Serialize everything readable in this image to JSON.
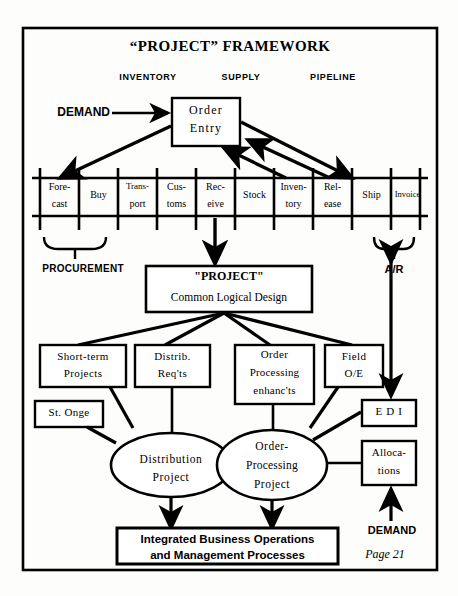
{
  "page": {
    "title": "“PROJECT”  FRAMEWORK",
    "page_number": "Page  21",
    "frame_color": "#000000",
    "bg_color": "#fdfdfb"
  },
  "column_headers": [
    {
      "label": "INVENTORY"
    },
    {
      "label": "SUPPLY"
    },
    {
      "label": "PIPELINE"
    }
  ],
  "demand_top": {
    "label": "DEMAND"
  },
  "demand_bottom": {
    "label": "DEMAND"
  },
  "order_entry": {
    "line1": "Order",
    "line2": "Entry"
  },
  "pipeline": {
    "cells": [
      {
        "line1": "Fore-",
        "line2": "cast"
      },
      {
        "line1": "Buy",
        "line2": ""
      },
      {
        "line1": "Trans-",
        "line2": "port"
      },
      {
        "line1": "Cus-",
        "line2": "toms"
      },
      {
        "line1": "Rec-",
        "line2": "eive"
      },
      {
        "line1": "Stock",
        "line2": ""
      },
      {
        "line1": "Inven-",
        "line2": "tory"
      },
      {
        "line1": "Rel-",
        "line2": "ease"
      },
      {
        "line1": "Ship",
        "line2": ""
      },
      {
        "line1": "Invoice",
        "line2": ""
      }
    ]
  },
  "brace_labels": {
    "procurement": "PROCUREMENT",
    "ar": "A/R"
  },
  "project_box": {
    "line1": "\"PROJECT\"",
    "line2": "Common  Logical  Design"
  },
  "initiative_boxes": [
    {
      "line1": "Short-term",
      "line2": "Projects",
      "line3": ""
    },
    {
      "line1": "Distrib.",
      "line2": "Req'ts",
      "line3": ""
    },
    {
      "line1": "Order",
      "line2": "Processing",
      "line3": "enhanc'ts"
    },
    {
      "line1": "Field",
      "line2": "O/E",
      "line3": ""
    }
  ],
  "side_boxes": {
    "st_onge": "St.  Onge",
    "edi": "E D I",
    "allocations_line1": "Alloca-",
    "allocations_line2": "tions"
  },
  "ellipses": [
    {
      "line1": "Distribution",
      "line2": "Project"
    },
    {
      "line1": "Order-",
      "line2": "Processing",
      "line3": "Project"
    }
  ],
  "outcome_box": {
    "line1": "Integrated  Business  Operations",
    "line2": "and  Management  Processes"
  }
}
